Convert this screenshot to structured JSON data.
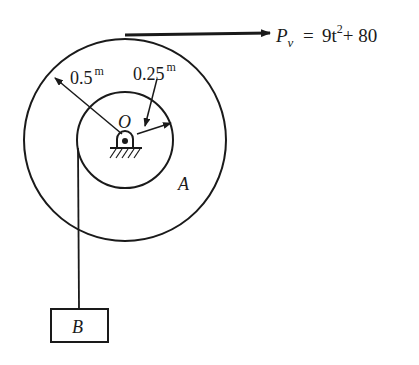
{
  "diagram": {
    "type": "pulley-system",
    "force": {
      "symbol": "P",
      "subscript": "v",
      "equals": "=",
      "expr_a": "9t",
      "exponent": "2",
      "expr_b": "+ 80"
    },
    "outer_radius": {
      "value": "0.5",
      "unit": "m"
    },
    "inner_radius": {
      "value": "0.25",
      "unit": "m"
    },
    "center_label": "O",
    "pulley_label": "A",
    "block_label": "B",
    "colors": {
      "ink": "#1a1a1a",
      "background": "#ffffff"
    }
  }
}
